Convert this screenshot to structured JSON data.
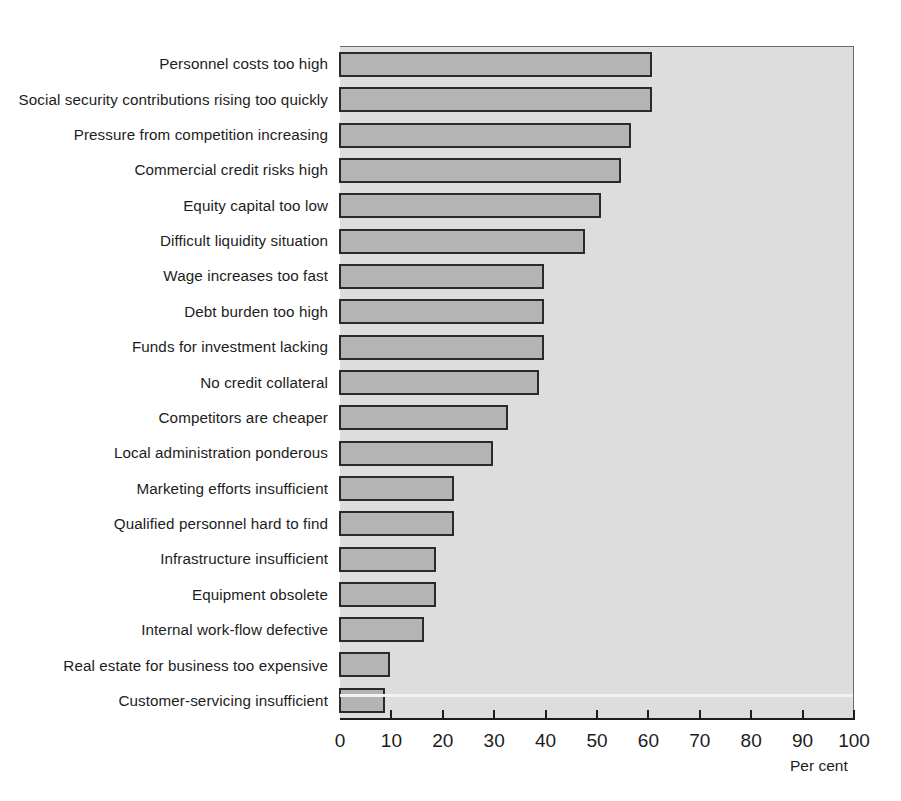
{
  "chart_data": {
    "type": "bar",
    "orientation": "horizontal",
    "title": "",
    "xlabel": "Per cent",
    "ylabel": "",
    "xlim": [
      0,
      100
    ],
    "xticks": [
      0,
      10,
      20,
      30,
      40,
      50,
      60,
      70,
      80,
      90,
      100
    ],
    "grid": false,
    "legend": null,
    "categories": [
      "Personnel costs too high",
      "Social security contributions rising too quickly",
      "Pressure from competition increasing",
      "Commercial credit risks high",
      "Equity capital too low",
      "Difficult liquidity situation",
      "Wage increases too fast",
      "Debt burden too high",
      "Funds for investment lacking",
      "No credit collateral",
      "Competitors are cheaper",
      "Local administration ponderous",
      "Marketing efforts insufficient",
      "Qualified personnel hard to find",
      "Infrastructure insufficient",
      "Equipment obsolete",
      "Internal work-flow defective",
      "Real estate for business too expensive",
      "Customer-servicing insufficient"
    ],
    "values": [
      61,
      61,
      57,
      55,
      51,
      48,
      40,
      40,
      40,
      39,
      33,
      30,
      22.5,
      22.5,
      19,
      19,
      16.5,
      10,
      9
    ],
    "colors": {
      "bar_fill": "#b4b4b4",
      "bar_edge": "#2a2a2a",
      "plot_background": "#dddddd",
      "axis": "#1d1d1d",
      "text": "#1d1d1d"
    }
  }
}
